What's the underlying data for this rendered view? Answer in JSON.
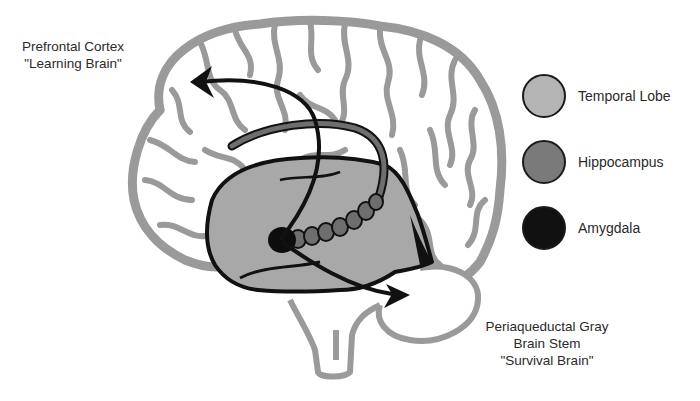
{
  "labels": {
    "prefrontal": {
      "line1": "Prefrontal Cortex",
      "line2": "\"Learning Brain\""
    },
    "brainstem": {
      "line1": "Periaqueductal Gray",
      "line2": "Brain Stem",
      "line3": "\"Survival Brain\""
    }
  },
  "legend": {
    "items": [
      {
        "label": "Temporal Lobe",
        "color": "#b4b4b4"
      },
      {
        "label": "Hippocampus",
        "color": "#7a7a7a"
      },
      {
        "label": "Amygdala",
        "color": "#111111"
      }
    ]
  },
  "colors": {
    "brain_outline": "#9a9a9a",
    "temporal_lobe": "#a8a8a8",
    "hippocampus": "#6e6e6e",
    "amygdala": "#0d0d0d",
    "arrow": "#111111"
  }
}
